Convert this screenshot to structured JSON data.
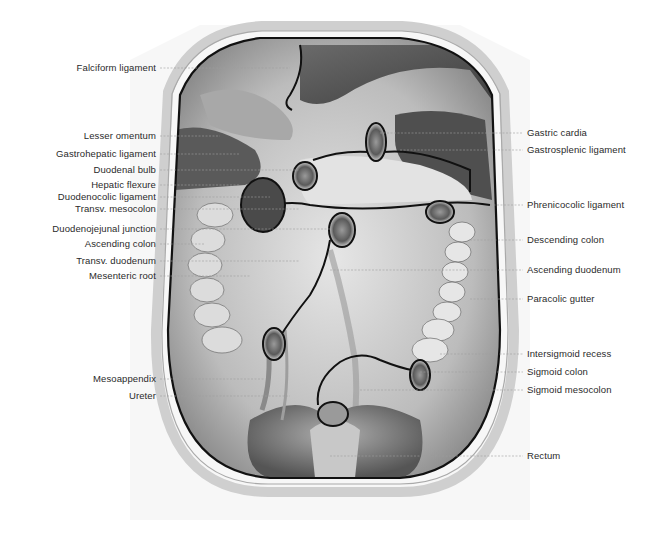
{
  "figure": {
    "type": "anatomical-illustration",
    "colors": {
      "background": "#ffffff",
      "ink": "#111111",
      "shading_dark": "#4a4a4a",
      "shading_mid": "#8c8c8c",
      "shading_light": "#d8d8d8",
      "label_text": "#2a2a2a",
      "leader_line": "#9a9a9a"
    }
  },
  "labels_left": [
    {
      "text": "Falciform ligament",
      "y": 68,
      "target_x": 290
    },
    {
      "text": "Lesser omentum",
      "y": 136,
      "target_x": 220
    },
    {
      "text": "Gastrohepatic ligament",
      "y": 154,
      "target_x": 240
    },
    {
      "text": "Duodenal bulb",
      "y": 170,
      "target_x": 300
    },
    {
      "text": "Hepatic flexure",
      "y": 185,
      "target_x": 240
    },
    {
      "text": "Duodenocolic ligament",
      "y": 197,
      "target_x": 270
    },
    {
      "text": "Transv. mesocolon",
      "y": 209,
      "target_x": 300
    },
    {
      "text": "Duodenojejunal junction",
      "y": 229,
      "target_x": 330
    },
    {
      "text": "Ascending colon",
      "y": 244,
      "target_x": 205
    },
    {
      "text": "Transv. duodenum",
      "y": 261,
      "target_x": 300
    },
    {
      "text": "Mesenteric root",
      "y": 276,
      "target_x": 250
    },
    {
      "text": "Mesoappendix",
      "y": 379,
      "target_x": 265
    },
    {
      "text": "Ureter",
      "y": 396,
      "target_x": 290
    }
  ],
  "labels_right": [
    {
      "text": "Gastric cardia",
      "y": 133,
      "target_x": 380
    },
    {
      "text": "Gastrosplenic ligament",
      "y": 150,
      "target_x": 400
    },
    {
      "text": "Phrenicocolic ligament",
      "y": 205,
      "target_x": 490
    },
    {
      "text": "Descending colon",
      "y": 240,
      "target_x": 470
    },
    {
      "text": "Ascending duodenum",
      "y": 270,
      "target_x": 330
    },
    {
      "text": "Paracolic gutter",
      "y": 299,
      "target_x": 470
    },
    {
      "text": "Intersigmoid recess",
      "y": 354,
      "target_x": 440
    },
    {
      "text": "Sigmoid colon",
      "y": 372,
      "target_x": 420
    },
    {
      "text": "Sigmoid mesocolon",
      "y": 390,
      "target_x": 360
    },
    {
      "text": "Rectum",
      "y": 456,
      "target_x": 330
    }
  ]
}
